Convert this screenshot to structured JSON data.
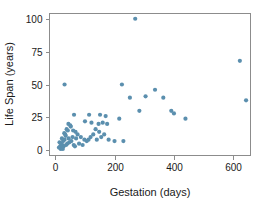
{
  "chart_data": {
    "type": "scatter",
    "title": "",
    "xlabel": "Gestation (days)",
    "ylabel": "Life Span (years)",
    "xlim": [
      -20,
      660
    ],
    "ylim": [
      -4,
      104
    ],
    "xticks": [
      0,
      200,
      400,
      600
    ],
    "yticks": [
      0,
      25,
      50,
      75,
      100
    ],
    "grid": false,
    "legend": null,
    "marker_color": "#5b8fae",
    "marker_size": 2.1,
    "frame_color": "#8c8c8c",
    "points": [
      {
        "x": 31,
        "y": 50
      },
      {
        "x": 270,
        "y": 100
      },
      {
        "x": 624,
        "y": 68
      },
      {
        "x": 645,
        "y": 38
      },
      {
        "x": 225,
        "y": 50
      },
      {
        "x": 252,
        "y": 40
      },
      {
        "x": 337,
        "y": 46
      },
      {
        "x": 305,
        "y": 41
      },
      {
        "x": 365,
        "y": 40
      },
      {
        "x": 284,
        "y": 30
      },
      {
        "x": 392,
        "y": 30
      },
      {
        "x": 401,
        "y": 28
      },
      {
        "x": 440,
        "y": 24
      },
      {
        "x": 216,
        "y": 24
      },
      {
        "x": 63,
        "y": 27
      },
      {
        "x": 151,
        "y": 27
      },
      {
        "x": 170,
        "y": 26
      },
      {
        "x": 114,
        "y": 27
      },
      {
        "x": 100,
        "y": 22
      },
      {
        "x": 122,
        "y": 21
      },
      {
        "x": 160,
        "y": 21
      },
      {
        "x": 175,
        "y": 20
      },
      {
        "x": 146,
        "y": 20
      },
      {
        "x": 44,
        "y": 20
      },
      {
        "x": 50,
        "y": 19
      },
      {
        "x": 52,
        "y": 18
      },
      {
        "x": 38,
        "y": 16
      },
      {
        "x": 42,
        "y": 15
      },
      {
        "x": 60,
        "y": 15
      },
      {
        "x": 68,
        "y": 14
      },
      {
        "x": 30,
        "y": 13
      },
      {
        "x": 33,
        "y": 12
      },
      {
        "x": 136,
        "y": 16
      },
      {
        "x": 148,
        "y": 14
      },
      {
        "x": 128,
        "y": 12
      },
      {
        "x": 119,
        "y": 10
      },
      {
        "x": 112,
        "y": 8
      },
      {
        "x": 106,
        "y": 7
      },
      {
        "x": 98,
        "y": 8
      },
      {
        "x": 86,
        "y": 10
      },
      {
        "x": 75,
        "y": 12
      },
      {
        "x": 70,
        "y": 9
      },
      {
        "x": 58,
        "y": 10
      },
      {
        "x": 54,
        "y": 7
      },
      {
        "x": 47,
        "y": 6
      },
      {
        "x": 40,
        "y": 5
      },
      {
        "x": 36,
        "y": 4
      },
      {
        "x": 28,
        "y": 3
      },
      {
        "x": 24,
        "y": 4
      },
      {
        "x": 21,
        "y": 2
      },
      {
        "x": 19,
        "y": 5
      },
      {
        "x": 26,
        "y": 7
      },
      {
        "x": 31,
        "y": 8
      },
      {
        "x": 45,
        "y": 9
      },
      {
        "x": 62,
        "y": 4
      },
      {
        "x": 66,
        "y": 3
      },
      {
        "x": 80,
        "y": 5
      },
      {
        "x": 92,
        "y": 4
      },
      {
        "x": 16,
        "y": 3
      },
      {
        "x": 22,
        "y": 9
      },
      {
        "x": 35,
        "y": 11
      },
      {
        "x": 180,
        "y": 8
      },
      {
        "x": 200,
        "y": 7
      },
      {
        "x": 230,
        "y": 7
      },
      {
        "x": 165,
        "y": 12
      },
      {
        "x": 155,
        "y": 10
      },
      {
        "x": 140,
        "y": 8
      },
      {
        "x": 14,
        "y": 6
      },
      {
        "x": 18,
        "y": 1
      },
      {
        "x": 25,
        "y": 1
      },
      {
        "x": 12,
        "y": 2
      }
    ]
  }
}
